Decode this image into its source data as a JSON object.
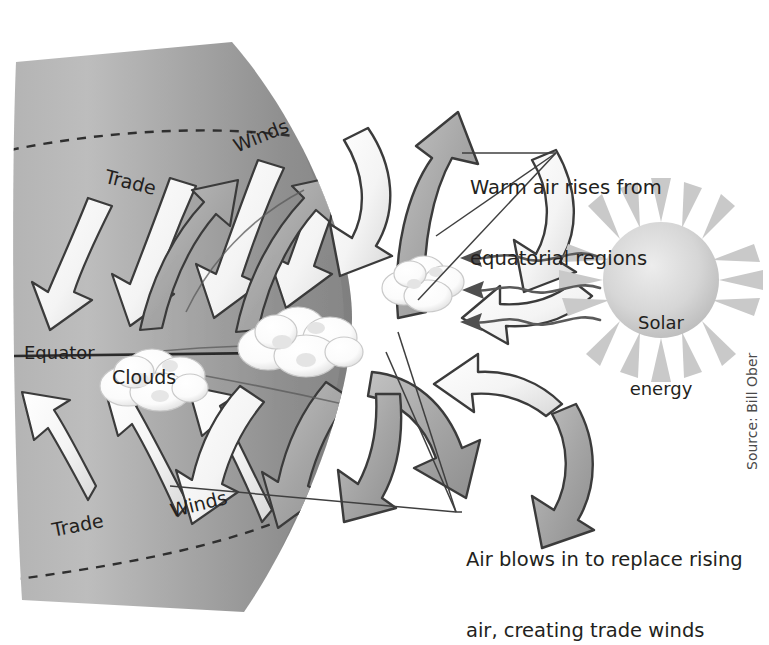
{
  "figure": {
    "type": "diagram",
    "credit": "Source: Bill Ober"
  },
  "globe": {
    "equator_label": "Equator",
    "clouds_label": "Clouds",
    "wind_labels": {
      "trade_top": "Trade",
      "winds_top": "Winds",
      "trade_bottom": "Trade",
      "winds_bottom": "Winds"
    }
  },
  "sun": {
    "label_line1": "Solar",
    "label_line2": "energy",
    "ray_count": 3
  },
  "callouts": {
    "warm_air": {
      "line1": "Warm air rises from",
      "line2": "equatorial regions"
    },
    "trade_winds": {
      "line1": "Air blows in to replace rising",
      "line2": "air, creating trade winds"
    }
  },
  "colors": {
    "background": "#ffffff",
    "globe_light": "#b9b9b9",
    "globe_mid": "#a3a3a3",
    "globe_dark": "#8d8d8d",
    "arrow_white": "#f2f2f2",
    "arrow_gray": "#a8a8a8",
    "outline": "#3a3a3a",
    "text": "#231f20",
    "sun_body": "#d2d2d2",
    "cloud": "#fdfdfd"
  }
}
